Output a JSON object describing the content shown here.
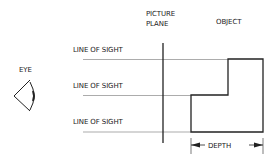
{
  "diagram": {
    "labels": {
      "eye": "EYE",
      "picture_plane_line1": "PICTURE",
      "picture_plane_line2": "PLANE",
      "object": "OBJECT",
      "lines_of_sight": [
        "LINE OF SIGHT",
        "LINE OF SIGHT",
        "LINE OF SIGHT"
      ],
      "depth": "DEPTH"
    },
    "colors": {
      "stroke": "#222222",
      "sight_line": "#888888",
      "background": "#ffffff"
    }
  }
}
